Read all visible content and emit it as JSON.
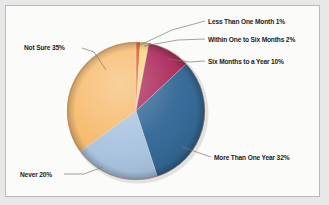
{
  "chart_data": {
    "type": "pie",
    "title": "",
    "subtitle": "",
    "xlabel": "",
    "ylabel": "",
    "legend_position": "none",
    "grid": false,
    "labels_outside": true,
    "categories": [
      "Less Than One Month",
      "Within One to Six Months",
      "Six Months to a Year",
      "More Than One Year",
      "Never",
      "Not Sure"
    ],
    "values": [
      1,
      2,
      10,
      32,
      20,
      35
    ],
    "value_suffix": "%",
    "colors": [
      "#e8521f",
      "#f6d67a",
      "#a82255",
      "#2e6494",
      "#a8c3e0",
      "#f6b96a"
    ],
    "slices": [
      {
        "label": "Less Than One Month",
        "value": 1,
        "label_text": "Less Than One Month 1%",
        "color": "#e8521f"
      },
      {
        "label": "Within One to Six Months",
        "value": 2,
        "label_text": "Within One to Six Months 2%",
        "color": "#f6d67a"
      },
      {
        "label": "Six Months to a Year",
        "value": 10,
        "label_text": "Six Months to a Year 10%",
        "color": "#a82255"
      },
      {
        "label": "More Than One Year",
        "value": 32,
        "label_text": "More Than One Year 32%",
        "color": "#2e6494"
      },
      {
        "label": "Never",
        "value": 20,
        "label_text": "Never 20%",
        "color": "#a8c3e0"
      },
      {
        "label": "Not Sure",
        "value": 35,
        "label_text": "Not Sure 35%",
        "color": "#f6b96a"
      }
    ]
  },
  "labels": {
    "less_than_one_month": "Less Than One Month 1%",
    "within_one_to_six_months": "Within One to Six Months 2%",
    "six_months_to_a_year": "Six Months to a Year 10%",
    "more_than_one_year": "More Than One Year 32%",
    "never": "Never 20%",
    "not_sure": "Not Sure 35%"
  },
  "style": {
    "panel_background": "#fbfbfa",
    "page_background": "#e8e8e8",
    "panel_border": "#b9b9b9",
    "leader_line_color": "#7a7a7a",
    "label_text_color": "#1c1c1c"
  }
}
